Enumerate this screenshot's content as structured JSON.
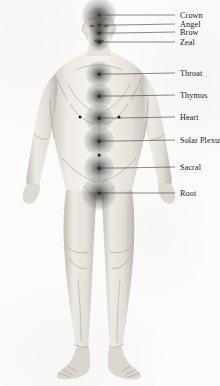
{
  "diagram": {
    "background_color": "#fbfbfa",
    "label_color": "#1d1d1d",
    "leader_line_color": "#3a3a3a",
    "glow_color": "#4a4a4a",
    "figure_tone": "#b9b4ad"
  },
  "chakras": [
    {
      "id": "crown",
      "label": "Crown",
      "point_x": 99,
      "point_y": 15,
      "label_x": 180,
      "label_y": 15,
      "glow_size": 34
    },
    {
      "id": "angel",
      "label": "Angel",
      "point_x": 99,
      "point_y": 25,
      "label_x": 180,
      "label_y": 24,
      "glow_size": 22
    },
    {
      "id": "brow",
      "label": "Brow",
      "point_x": 99,
      "point_y": 33,
      "label_x": 180,
      "label_y": 32,
      "glow_size": 20
    },
    {
      "id": "zeal",
      "label": "Zeal",
      "point_x": 99,
      "point_y": 42,
      "label_x": 180,
      "label_y": 42,
      "glow_size": 18
    },
    {
      "id": "throat",
      "label": "Throat",
      "point_x": 99,
      "point_y": 74,
      "label_x": 180,
      "label_y": 73,
      "glow_size": 26
    },
    {
      "id": "thymus",
      "label": "Thymus",
      "point_x": 99,
      "point_y": 96,
      "label_x": 180,
      "label_y": 95,
      "glow_size": 26
    },
    {
      "id": "heart",
      "label": "Heart",
      "point_x": 99,
      "point_y": 118,
      "label_x": 180,
      "label_y": 117,
      "glow_size": 28
    },
    {
      "id": "solar-plexus",
      "label": "Solar Plexus",
      "point_x": 99,
      "point_y": 141,
      "label_x": 180,
      "label_y": 140,
      "glow_size": 30
    },
    {
      "id": "sacral",
      "label": "Sacral",
      "point_x": 99,
      "point_y": 168,
      "label_x": 180,
      "label_y": 167,
      "glow_size": 30
    },
    {
      "id": "root",
      "label": "Root",
      "point_x": 99,
      "point_y": 193,
      "label_x": 180,
      "label_y": 193,
      "glow_size": 34
    }
  ],
  "anatomy_marks": [
    {
      "id": "nipple-left",
      "x": 80,
      "y": 117
    },
    {
      "id": "nipple-right",
      "x": 119,
      "y": 117
    },
    {
      "id": "navel",
      "x": 99,
      "y": 155
    }
  ]
}
